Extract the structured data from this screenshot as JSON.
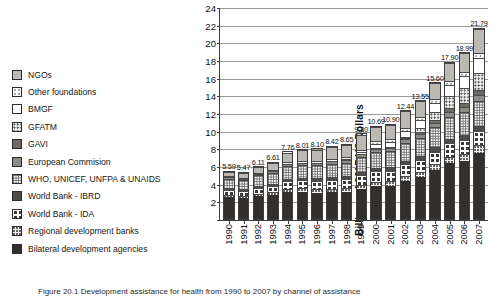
{
  "figure": {
    "caption": "Figure 20.1  Development assistance for health from 1990 to 2007 by channel of assistance"
  },
  "legend": {
    "items": [
      {
        "label": "NGOs",
        "pattern": "f-ltgray"
      },
      {
        "label": "Other foundations",
        "pattern": "f-dotsparse"
      },
      {
        "label": "BMGF",
        "pattern": "f-white"
      },
      {
        "label": "GFATM",
        "pattern": "f-gfatm"
      },
      {
        "label": "GAVI",
        "pattern": "f-gavi"
      },
      {
        "label": "European Commision",
        "pattern": "f-midgray"
      },
      {
        "label": "WHO, UNICEF, UNFPA & UNAIDS",
        "pattern": "f-gridfine"
      },
      {
        "label": "World Bank - IBRD",
        "pattern": "f-darkgray"
      },
      {
        "label": "World Bank - IDA",
        "pattern": "f-circles"
      },
      {
        "label": "Regional development banks",
        "pattern": "f-dotgrid-lt"
      },
      {
        "label": "Bilateral development agencies",
        "pattern": "f-solidblack"
      }
    ]
  },
  "chart_data": {
    "type": "bar",
    "stacked": true,
    "title": "",
    "xlabel": "",
    "ylabel": "Billions of 2007 US Dollars",
    "ylim": [
      0,
      24
    ],
    "yticks": [
      0,
      2,
      4,
      6,
      8,
      10,
      12,
      14,
      16,
      18,
      20,
      22,
      24
    ],
    "ytick_labels": [
      "",
      "2",
      "4",
      "6",
      "8",
      "10",
      "12",
      "14",
      "16",
      "18",
      "20",
      "22",
      "24"
    ],
    "grid": true,
    "legend_position": "left-outside",
    "categories": [
      "1990",
      "1991",
      "1992",
      "1993",
      "1994",
      "1995",
      "1996",
      "1997",
      "1998",
      "1999",
      "2000",
      "2001",
      "2002",
      "2003",
      "2004",
      "2005",
      "2006",
      "2007"
    ],
    "totals": [
      5.59,
      5.47,
      6.11,
      6.61,
      7.76,
      8.01,
      8.1,
      8.42,
      8.65,
      9.8,
      10.69,
      10.9,
      12.44,
      13.55,
      15.6,
      17.9,
      18.99,
      21.79
    ],
    "total_labels": [
      "5.59",
      "5.47",
      "6.11",
      "6.61",
      "7.76",
      "8.01",
      "8.10",
      "8.42",
      "8.65",
      "9.80",
      "10.69",
      "10.90",
      "12.44",
      "13.55",
      "15.60",
      "17.90",
      "18.99",
      "21.79"
    ],
    "series": [
      {
        "name": "Bilateral development agencies",
        "pattern": "f-solidblack",
        "values": [
          2.55,
          2.45,
          2.7,
          2.8,
          3.1,
          3.15,
          3.05,
          3.1,
          3.2,
          3.45,
          3.8,
          3.85,
          4.4,
          4.8,
          5.6,
          6.4,
          6.7,
          7.6
        ]
      },
      {
        "name": "Regional development banks",
        "pattern": "f-dotgrid-lt",
        "values": [
          0.28,
          0.26,
          0.3,
          0.33,
          0.4,
          0.42,
          0.42,
          0.44,
          0.45,
          0.5,
          0.52,
          0.54,
          0.6,
          0.62,
          0.68,
          0.74,
          0.78,
          0.82
        ]
      },
      {
        "name": "World Bank - IDA",
        "pattern": "f-circles",
        "values": [
          0.62,
          0.6,
          0.7,
          0.76,
          0.9,
          0.94,
          0.95,
          0.98,
          1.0,
          1.1,
          1.18,
          1.2,
          1.3,
          1.35,
          1.45,
          1.55,
          1.6,
          1.7
        ]
      },
      {
        "name": "World Bank - IBRD",
        "pattern": "f-darkgray",
        "values": [
          0.22,
          0.2,
          0.24,
          0.26,
          0.3,
          0.32,
          0.32,
          0.33,
          0.34,
          0.37,
          0.4,
          0.41,
          0.44,
          0.46,
          0.5,
          0.52,
          0.54,
          0.56
        ]
      },
      {
        "name": "WHO, UNICEF, UNFPA & UNAIDS",
        "pattern": "f-gridfine",
        "values": [
          1.1,
          1.08,
          1.18,
          1.26,
          1.45,
          1.48,
          1.52,
          1.56,
          1.58,
          1.72,
          1.82,
          1.84,
          2.0,
          2.1,
          2.3,
          2.5,
          2.6,
          2.85
        ]
      },
      {
        "name": "European Commision",
        "pattern": "f-midgray",
        "values": [
          0.18,
          0.17,
          0.2,
          0.22,
          0.26,
          0.28,
          0.29,
          0.3,
          0.31,
          0.35,
          0.38,
          0.39,
          0.44,
          0.48,
          0.54,
          0.6,
          0.64,
          0.7
        ]
      },
      {
        "name": "GAVI",
        "pattern": "f-gavi",
        "values": [
          0.0,
          0.0,
          0.0,
          0.0,
          0.0,
          0.0,
          0.0,
          0.0,
          0.0,
          0.0,
          0.12,
          0.16,
          0.22,
          0.26,
          0.32,
          0.38,
          0.42,
          0.48
        ]
      },
      {
        "name": "GFATM",
        "pattern": "f-gfatm",
        "values": [
          0.0,
          0.0,
          0.0,
          0.0,
          0.0,
          0.0,
          0.0,
          0.0,
          0.0,
          0.0,
          0.0,
          0.0,
          0.1,
          0.45,
          0.95,
          1.4,
          1.7,
          2.05
        ]
      },
      {
        "name": "BMGF",
        "pattern": "f-white",
        "values": [
          0.0,
          0.0,
          0.0,
          0.0,
          0.0,
          0.0,
          0.0,
          0.0,
          0.05,
          0.3,
          0.5,
          0.55,
          0.7,
          0.85,
          1.0,
          1.25,
          1.4,
          1.65
        ]
      },
      {
        "name": "Other foundations",
        "pattern": "f-dotsparse",
        "values": [
          0.14,
          0.13,
          0.15,
          0.16,
          0.19,
          0.2,
          0.21,
          0.22,
          0.22,
          0.25,
          0.27,
          0.28,
          0.32,
          0.36,
          0.42,
          0.48,
          0.52,
          0.58
        ]
      },
      {
        "name": "NGOs",
        "pattern": "f-ltgray",
        "values": [
          0.5,
          0.58,
          0.64,
          0.82,
          1.16,
          1.22,
          1.34,
          1.49,
          1.5,
          1.76,
          1.7,
          1.68,
          1.92,
          1.82,
          1.84,
          2.08,
          2.09,
          2.8
        ]
      }
    ]
  }
}
